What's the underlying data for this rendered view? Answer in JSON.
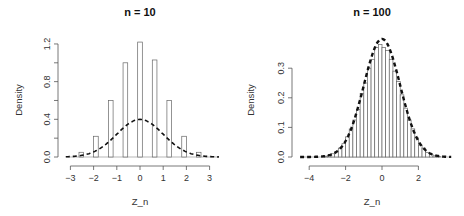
{
  "chart_data": [
    {
      "type": "bar",
      "subtype": "histogram-with-density-curve",
      "title": "n = 10",
      "xlabel": "Z_n",
      "ylabel": "Density",
      "xlim": [
        -3.2,
        3.4
      ],
      "ylim": [
        0,
        1.2
      ],
      "xticks": [
        -3,
        -2,
        -1,
        0,
        1,
        2,
        3
      ],
      "yticks": [
        0.0,
        0.4,
        0.8,
        1.2
      ],
      "ytick_labels": [
        "0.0",
        "0.4",
        "0.8",
        "1.2"
      ],
      "bar_width": 0.2,
      "x": [
        -2.53,
        -1.9,
        -1.26,
        -0.63,
        0.0,
        0.63,
        1.26,
        1.9,
        2.53
      ],
      "values": [
        0.05,
        0.22,
        0.6,
        1.0,
        1.22,
        1.03,
        0.6,
        0.22,
        0.05
      ],
      "curve": {
        "name": "Normal(0,1) density",
        "style": "dashed",
        "peak": 0.399
      },
      "grid": false
    },
    {
      "type": "bar",
      "subtype": "histogram-with-density-curve",
      "title": "n = 100",
      "xlabel": "Z_n",
      "ylabel": "Density",
      "xlim": [
        -4.5,
        3.8
      ],
      "ylim": [
        0,
        0.35
      ],
      "xticks": [
        -4,
        -2,
        0,
        2
      ],
      "yticks": [
        0.0,
        0.1,
        0.2,
        0.3
      ],
      "ytick_labels": [
        "0.0",
        "0.1",
        "0.2",
        "0.3"
      ],
      "bar_width": 0.2,
      "x": [
        -3.1,
        -2.9,
        -2.7,
        -2.5,
        -2.3,
        -2.1,
        -1.9,
        -1.7,
        -1.5,
        -1.3,
        -1.1,
        -0.9,
        -0.7,
        -0.5,
        -0.3,
        -0.1,
        0.1,
        0.3,
        0.5,
        0.7,
        0.9,
        1.1,
        1.3,
        1.5,
        1.7,
        1.9,
        2.1,
        2.3,
        2.5,
        2.7,
        2.9,
        3.1
      ],
      "values": [
        0.003,
        0.006,
        0.011,
        0.018,
        0.03,
        0.045,
        0.068,
        0.095,
        0.125,
        0.16,
        0.215,
        0.25,
        0.3,
        0.33,
        0.37,
        0.38,
        0.37,
        0.36,
        0.33,
        0.29,
        0.255,
        0.21,
        0.165,
        0.125,
        0.095,
        0.065,
        0.04,
        0.03,
        0.015,
        0.008,
        0.004,
        0.002
      ],
      "curve": {
        "name": "Normal(0,1) density",
        "style": "dashed",
        "peak": 0.399
      },
      "grid": false
    }
  ]
}
